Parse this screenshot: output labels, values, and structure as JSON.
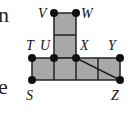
{
  "text_fragments": {
    "top": "n",
    "bottom": "e"
  },
  "figure": {
    "fill_color": "#a8a8a8",
    "line_color": "#222222",
    "points": {
      "V": {
        "label": "V",
        "x": 54,
        "y": 13
      },
      "W": {
        "label": "W",
        "x": 76,
        "y": 13
      },
      "T": {
        "label": "T",
        "x": 32,
        "y": 58
      },
      "U": {
        "label": "U",
        "x": 54,
        "y": 58
      },
      "X": {
        "label": "X",
        "x": 76,
        "y": 58
      },
      "Y": {
        "label": "Y",
        "x": 120,
        "y": 58
      },
      "S": {
        "label": "S",
        "x": 32,
        "y": 80
      },
      "Z": {
        "label": "Z",
        "x": 120,
        "y": 80
      }
    },
    "segments_note": "Grid of unit squares: vertical column of 2 squares (V-W to U-X), bottom row of 4 squares (T-Y to S-Z), diagonal X to Z"
  }
}
